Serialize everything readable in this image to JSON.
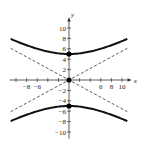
{
  "chart_data": {
    "type": "line",
    "title": "",
    "xlabel": "x",
    "ylabel": "y",
    "xlim": [
      -11,
      11
    ],
    "ylim": [
      -11,
      11
    ],
    "grid": false,
    "x_tick_labels": [
      "-8",
      "-6",
      "6",
      "8",
      "10"
    ],
    "x_tick_values": [
      -10,
      -8,
      -6,
      -4,
      -2,
      2,
      4,
      6,
      8,
      10
    ],
    "y_tick_labels": [
      "10",
      "8",
      "6",
      "4",
      "2",
      "-2",
      "-4",
      "-6",
      "-8",
      "-10"
    ],
    "y_tick_values": [
      10,
      8,
      6,
      4,
      2,
      -2,
      -4,
      -6,
      -8,
      -10
    ],
    "equation": "y^2/25 - x^2/81 = 1",
    "series": [
      {
        "name": "hyperbola upper branch",
        "style": "solid-thick",
        "x": [
          -11,
          -8,
          -6,
          -4,
          -2,
          0,
          2,
          4,
          6,
          8,
          11
        ],
        "y": [
          7.9,
          6.7,
          6.0,
          5.5,
          5.1,
          5,
          5.1,
          5.5,
          6.0,
          6.7,
          7.9
        ]
      },
      {
        "name": "hyperbola lower branch",
        "style": "solid-thick",
        "x": [
          -11,
          -8,
          -6,
          -4,
          -2,
          0,
          2,
          4,
          6,
          8,
          11
        ],
        "y": [
          -7.9,
          -6.7,
          -6.0,
          -5.5,
          -5.1,
          -5,
          -5.1,
          -5.5,
          -6.0,
          -6.7,
          -7.9
        ]
      },
      {
        "name": "asymptote y = 5x/9",
        "style": "dashed",
        "x": [
          -11,
          11
        ],
        "y": [
          -6.1,
          6.1
        ]
      },
      {
        "name": "asymptote y = -5x/9",
        "style": "dashed",
        "x": [
          -11,
          11
        ],
        "y": [
          6.1,
          -6.1
        ]
      }
    ],
    "points": [
      {
        "label": "vertex",
        "x": 0,
        "y": 5
      },
      {
        "label": "center",
        "x": 0,
        "y": 0
      },
      {
        "label": "vertex",
        "x": 0,
        "y": -5
      }
    ]
  },
  "labels": {
    "x_axis": "x",
    "y_axis": "y"
  }
}
